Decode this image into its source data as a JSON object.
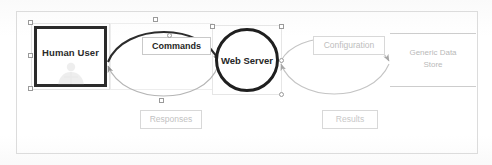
{
  "diagram": {
    "canvas": {
      "width": 492,
      "height": 165,
      "background": "#ffffff",
      "frame_color": "#dcdcdc"
    },
    "nodes": [
      {
        "id": "human-user",
        "label": "Human User",
        "shape": "rectangle",
        "style": "actor",
        "selected": true,
        "stroke": "#2b2b2b",
        "watermark_icon": "person-icon"
      },
      {
        "id": "web-server",
        "label": "Web Server",
        "shape": "circle",
        "style": "process",
        "selected": true,
        "stroke": "#1f1f1f"
      },
      {
        "id": "generic-data-store",
        "label": "Generic Data Store",
        "label_line1": "Generic Data",
        "label_line2": "Store",
        "shape": "open-rectangle",
        "style": "data-store",
        "selected": false,
        "stroke": "#cdcdcd"
      }
    ],
    "edges": [
      {
        "id": "commands",
        "label": "Commands",
        "from": "human-user",
        "to": "web-server",
        "direction": "forward",
        "curve": "arc-up",
        "emphasis": "bold",
        "stroke": "#2c2c2c"
      },
      {
        "id": "responses",
        "label": "Responses",
        "from": "web-server",
        "to": "human-user",
        "direction": "forward",
        "curve": "arc-down",
        "emphasis": "faint",
        "stroke": "#b5b5b5"
      },
      {
        "id": "configuration",
        "label": "Configuration",
        "from": "web-server",
        "to": "generic-data-store",
        "direction": "forward",
        "curve": "arc-up",
        "emphasis": "faint",
        "stroke": "#c4c4c4"
      },
      {
        "id": "results",
        "label": "Results",
        "from": "generic-data-store",
        "to": "web-server",
        "direction": "forward",
        "curve": "arc-down",
        "emphasis": "faint",
        "stroke": "#c4c4c4"
      }
    ],
    "selection": {
      "handle_fill": "#ffffff",
      "handle_stroke": "#9a9a9a",
      "handle_count": 10,
      "marquee_color": "#e2e2e2"
    },
    "colors": {
      "ink_dark": "#1f1f1f",
      "ink_mid": "#8d8d8d",
      "ink_faint": "#c4c4c4",
      "paper": "#ffffff",
      "frame": "#dcdcdc"
    }
  }
}
